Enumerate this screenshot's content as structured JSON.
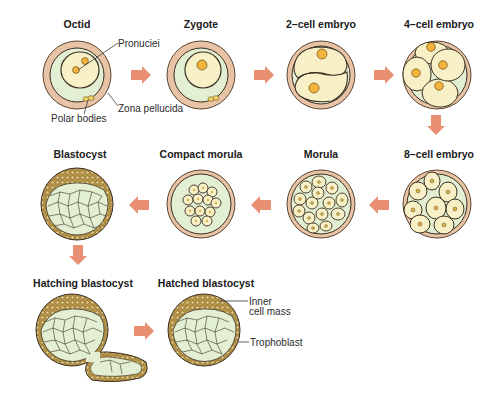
{
  "diagram": {
    "stages": [
      {
        "id": "octid",
        "label": "Octid"
      },
      {
        "id": "zygote",
        "label": "Zygote"
      },
      {
        "id": "two-cell",
        "label": "2–cell embryo"
      },
      {
        "id": "four-cell",
        "label": "4–cell embryo"
      },
      {
        "id": "eight-cell",
        "label": "8–cell embryo"
      },
      {
        "id": "morula",
        "label": "Morula"
      },
      {
        "id": "compact-morula",
        "label": "Compact morula"
      },
      {
        "id": "blastocyst",
        "label": "Blastocyst"
      },
      {
        "id": "hatching-blastocyst",
        "label": "Hatching blastocyst"
      },
      {
        "id": "hatched-blastocyst",
        "label": "Hatched blastocyst"
      }
    ],
    "annotations": {
      "pronuclei": "Pronuciei",
      "zona_pellucida": "Zona pellucida",
      "polar_bodies": "Polar bodies",
      "inner_cell_mass_1": "Inner",
      "inner_cell_mass_2": "cell mass",
      "trophoblast": "Trophoblast"
    },
    "colors": {
      "zona": "#e9c3a6",
      "cytoplasm": "#e3efd2",
      "cell": "#f8f1c7",
      "nucleus": "#f2b43a",
      "arrow": "#e98f74",
      "trophoblast": "#c9a85a",
      "outline": "#3a2f22"
    }
  }
}
